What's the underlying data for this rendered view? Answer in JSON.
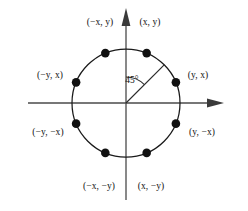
{
  "figure": {
    "shape": "circle",
    "stroke_color": "#1a1a1a",
    "point_color": "#111111",
    "axis_color": "#4a4a4a"
  },
  "geometry": {
    "center_x": 126,
    "center_y": 103,
    "radius": 54,
    "point_radius": 4.3,
    "axis_left_x": 28,
    "axis_right_x": 224,
    "axis_top_y": 8,
    "axis_bottom_y": 200,
    "angle_arc_radius": 26,
    "ray_angle_deg": 45
  },
  "angle": {
    "value": "45",
    "unit": "°",
    "text": "45°",
    "label_x": 132,
    "label_y": 80
  },
  "points": [
    {
      "id": "p-x-y",
      "label": "(x, y)",
      "angle_deg": 67.5,
      "label_x": 150,
      "label_y": 22,
      "anchor": "center"
    },
    {
      "id": "p-y-x",
      "label": "(y, x)",
      "angle_deg": 22.5,
      "label_x": 198,
      "label_y": 75,
      "anchor": "center"
    },
    {
      "id": "p-y-negx",
      "label": "(y, −x)",
      "angle_deg": -22.5,
      "label_x": 202,
      "label_y": 132,
      "anchor": "center"
    },
    {
      "id": "p-x-negy",
      "label": "(x, −y)",
      "angle_deg": -67.5,
      "label_x": 151,
      "label_y": 186,
      "anchor": "center"
    },
    {
      "id": "p-negx-negy",
      "label": "(−x, −y)",
      "angle_deg": 247.5,
      "label_x": 99,
      "label_y": 186,
      "anchor": "center"
    },
    {
      "id": "p-negy-negx",
      "label": "(−y, −x)",
      "angle_deg": 202.5,
      "label_x": 48,
      "label_y": 132,
      "anchor": "center"
    },
    {
      "id": "p-negy-x",
      "label": "(−y, x)",
      "angle_deg": 157.5,
      "label_x": 50,
      "label_y": 75,
      "anchor": "center"
    },
    {
      "id": "p-negx-y",
      "label": "(−x, y)",
      "angle_deg": 112.5,
      "label_x": 100,
      "label_y": 22,
      "anchor": "center"
    }
  ]
}
